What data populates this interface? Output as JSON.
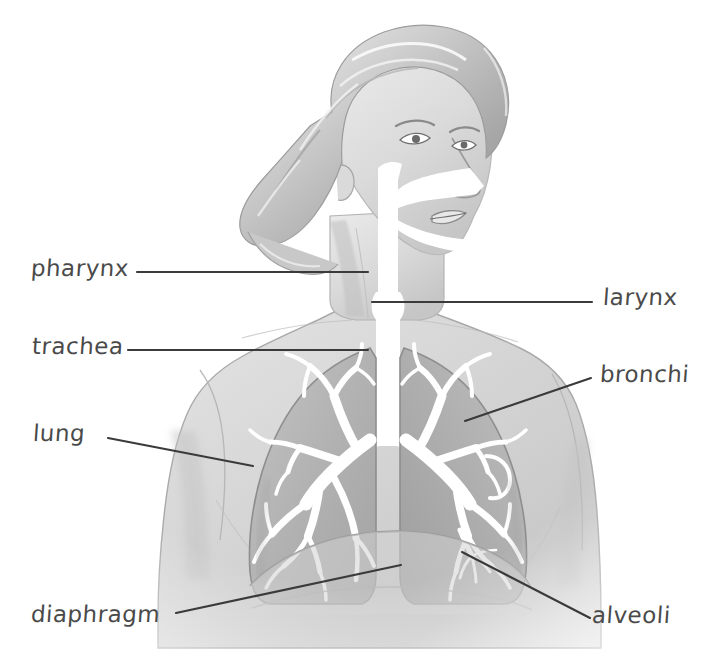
{
  "figure": {
    "style": "grayscale-pencil-illustration",
    "background_color": "#ffffff",
    "ink_color": "#3a3a3a",
    "skin_tone": "#d8d8d8",
    "lung_tone": "#b5b5b5",
    "airway_color": "#ffffff"
  },
  "labels": [
    {
      "id": "pharynx",
      "text": "pharynx",
      "side": "left",
      "leader": {
        "x1": 137,
        "y1": 272,
        "x2": 368,
        "y2": 272
      }
    },
    {
      "id": "trachea",
      "text": "trachea",
      "side": "left",
      "leader": {
        "x1": 128,
        "y1": 350,
        "x2": 368,
        "y2": 350
      }
    },
    {
      "id": "lung",
      "text": "lung",
      "side": "left",
      "leader": {
        "x1": 108,
        "y1": 438,
        "x2": 253,
        "y2": 466
      }
    },
    {
      "id": "diaphragm",
      "text": "diaphragm",
      "side": "left",
      "leader": {
        "x1": 176,
        "y1": 613,
        "x2": 401,
        "y2": 565
      }
    },
    {
      "id": "larynx",
      "text": "larynx",
      "side": "right",
      "leader": {
        "x1": 372,
        "y1": 302,
        "x2": 592,
        "y2": 302
      }
    },
    {
      "id": "bronchi",
      "text": "bronchi",
      "side": "right",
      "leader": {
        "x1": 465,
        "y1": 421,
        "x2": 591,
        "y2": 378
      }
    },
    {
      "id": "alveoli",
      "text": "alveoli",
      "side": "right",
      "leader": {
        "x1": 462,
        "y1": 552,
        "x2": 590,
        "y2": 618
      }
    }
  ]
}
